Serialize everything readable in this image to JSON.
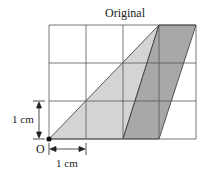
{
  "title": "Original",
  "origin_label": "O",
  "scale_x_label": "1 cm",
  "scale_y_label": "1 cm",
  "grid": {
    "columns": 4,
    "rows": 3,
    "unit": "1 cm"
  },
  "shapes": [
    {
      "name": "triangle",
      "vertices": [
        [
          0,
          0
        ],
        [
          3,
          3
        ],
        [
          2,
          0
        ]
      ],
      "fill": "#d6d6d6"
    },
    {
      "name": "parallelogram",
      "vertices": [
        [
          2,
          0
        ],
        [
          3,
          3
        ],
        [
          4,
          3
        ],
        [
          3,
          0
        ]
      ],
      "fill": "#a9a9a9"
    }
  ],
  "colors": {
    "grid": "#555555",
    "light_fill": "#d6d6d6",
    "dark_fill": "#a9a9a9"
  }
}
